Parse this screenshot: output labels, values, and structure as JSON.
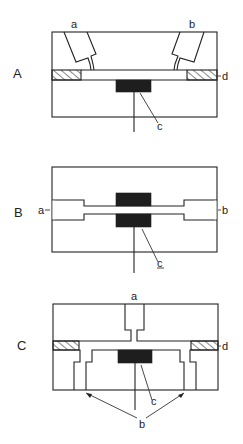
{
  "figure": {
    "panels": [
      {
        "id": "A",
        "label": "A",
        "parts": {
          "a": "a",
          "b": "b",
          "c": "c",
          "d": "d"
        }
      },
      {
        "id": "B",
        "label": "B",
        "parts": {
          "a": "a",
          "b": "b",
          "c": "c"
        }
      },
      {
        "id": "C",
        "label": "C",
        "parts": {
          "a": "a",
          "b": "b",
          "c": "c",
          "d": "d"
        }
      }
    ],
    "caption": ""
  },
  "colors": {
    "line": "#222222",
    "fill_dark": "#1e1e1e",
    "background": "#ffffff"
  }
}
